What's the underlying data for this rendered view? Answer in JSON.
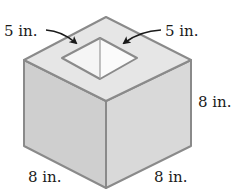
{
  "figure": {
    "colors": {
      "top_face": "#e6e6e6",
      "left_face": "#cfcfcf",
      "right_face": "#d9d9d9",
      "cavity_left": "#f5f5f5",
      "cavity_right": "#fbfbfb",
      "edge": "#8a8a8a",
      "arrow": "#1a1a1a"
    },
    "labels": {
      "cavity_left_side": "5 in.",
      "cavity_right_side": "5 in.",
      "cube_height": "8 in.",
      "cube_front_left_edge": "8 in.",
      "cube_front_right_edge": "8 in."
    }
  }
}
